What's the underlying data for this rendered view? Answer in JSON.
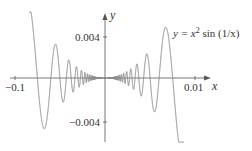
{
  "chart_data": {
    "type": "line",
    "title": "",
    "equation_label": {
      "prefix": "y = x",
      "exponent": "2",
      "suffix": " sin (1/x)"
    },
    "xlabel": "x",
    "ylabel": "y",
    "x_ticks": [
      {
        "value": -0.1,
        "label": "−0.1"
      },
      {
        "value": 0.01,
        "label": "0.01"
      }
    ],
    "y_ticks": [
      {
        "value": 0.004,
        "label": "0.004"
      },
      {
        "value": -0.004,
        "label": "−0.004"
      }
    ],
    "function": "x^2 sin(1/x)",
    "grid": false,
    "legend": "none",
    "series": [
      {
        "name": "y = x^2 sin(1/x)",
        "color": "#8a8a8a"
      }
    ],
    "key_points_px": {
      "left": [
        [
          29,
          19
        ],
        [
          33,
          78
        ],
        [
          42,
          133
        ],
        [
          54,
          44
        ],
        [
          61,
          104
        ],
        [
          67,
          59
        ],
        [
          72,
          92
        ]
      ],
      "right": [
        [
          133,
          88
        ],
        [
          139,
          64
        ],
        [
          143,
          98
        ],
        [
          149,
          53
        ],
        [
          157,
          115
        ],
        [
          168,
          26
        ],
        [
          183,
          140
        ]
      ]
    }
  },
  "render": {
    "origin_px": [
      105,
      78
    ],
    "amp_coeff": 0.0139,
    "freq_coeff": 850,
    "x_start_px": 29,
    "x_end_px": 184,
    "y_min_px": 12,
    "y_max_px": 142,
    "axis_color": "#555555",
    "curve_color": "#8a8a8a"
  },
  "labels": {
    "x_axis": "x",
    "y_axis": "y",
    "tick_x_neg": "−0.1",
    "tick_x_pos": "0.01",
    "tick_y_pos": "0.004",
    "tick_y_neg": "−0.004",
    "eq_prefix": "y = x",
    "eq_exp": "2",
    "eq_suffix": " sin (1/x)"
  }
}
